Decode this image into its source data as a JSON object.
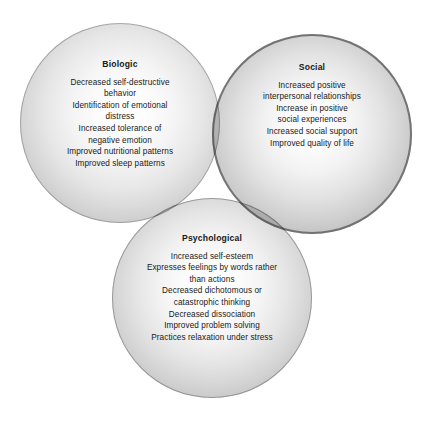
{
  "diagram": {
    "type": "venn",
    "circle_count": 3,
    "background_color": "#ffffff",
    "text_color": "#181818",
    "circles": [
      {
        "id": "biologic",
        "title": "Biologic",
        "center_x": 120,
        "center_y": 123,
        "radius": 100,
        "fill_start": "#ffffff",
        "fill_end": "#a8a8a8",
        "stroke": "#787878",
        "items": [
          {
            "line1": "Decreased self-destructive",
            "line2": "behavior"
          },
          {
            "line1": "Identification of emotional",
            "line2": "distress"
          },
          {
            "line1": "Increased tolerance of",
            "line2": "negative emotion"
          },
          {
            "line1": "Improved nutritional patterns",
            "line2": ""
          },
          {
            "line1": "Improved sleep patterns",
            "line2": ""
          }
        ]
      },
      {
        "id": "social",
        "title": "Social",
        "center_x": 312,
        "center_y": 134,
        "radius": 100,
        "fill_start": "#ffffff",
        "fill_end": "#9a9a9a",
        "stroke": "#5c5c5c",
        "items": [
          {
            "line1": "Increased positive",
            "line2": "interpersonal relationships"
          },
          {
            "line1": "Increase in positive",
            "line2": "social experiences"
          },
          {
            "line1": "Increased social support",
            "line2": ""
          },
          {
            "line1": "Improved quality of life",
            "line2": ""
          }
        ]
      },
      {
        "id": "psychological",
        "title": "Psychological",
        "center_x": 212,
        "center_y": 298,
        "radius": 100,
        "fill_start": "#ffffff",
        "fill_end": "#a5a5a5",
        "stroke": "#707070",
        "items": [
          {
            "line1": "Increased self-esteem",
            "line2": ""
          },
          {
            "line1": "Expresses feelings by words rather",
            "line2": "than actions"
          },
          {
            "line1": "Decreased dichotomous or",
            "line2": "catastrophic thinking"
          },
          {
            "line1": "Decreased dissociation",
            "line2": ""
          },
          {
            "line1": "Improved problem solving",
            "line2": ""
          },
          {
            "line1": "Practices relaxation under stress",
            "line2": ""
          }
        ]
      }
    ]
  }
}
